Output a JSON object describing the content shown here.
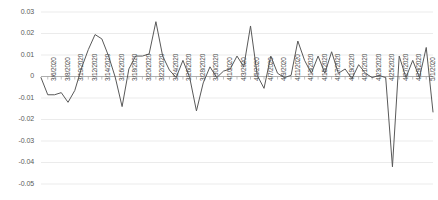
{
  "chart_data": {
    "type": "line",
    "title": "",
    "subtitle": "",
    "xlabel": "",
    "ylabel": "",
    "grid": true,
    "legend_position": "none",
    "series_color": "#595959",
    "ylim": [
      -0.05,
      0.03
    ],
    "ytick_labels": [
      "0.03",
      "0.02",
      "0.01",
      "0",
      "-0.01",
      "-0.02",
      "-0.03",
      "-0.04",
      "-0.05"
    ],
    "ytick_values": [
      0.03,
      0.02,
      0.01,
      0,
      -0.01,
      -0.02,
      -0.03,
      -0.04,
      -0.05
    ],
    "xtick_labels": [
      "3/6/2020",
      "3/8/2020",
      "3/10/2020",
      "3/12/2020",
      "3/14/2020",
      "3/16/2020",
      "3/18/2020",
      "3/20/2020",
      "3/22/2020",
      "3/24/2020",
      "3/26/2020",
      "3/28/2020",
      "3/30/2020",
      "4/1/2020",
      "4/3/2020",
      "4/5/2020",
      "4/7/2020",
      "4/9/2020",
      "4/11/2020",
      "4/13/2020",
      "4/15/2020",
      "4/17/2020",
      "4/19/2020",
      "4/21/2020",
      "4/23/2020",
      "4/25/2020",
      "4/27/2020",
      "4/29/2020",
      "5/1/2020"
    ],
    "x": [
      "3/5/2020",
      "3/6/2020",
      "3/7/2020",
      "3/8/2020",
      "3/9/2020",
      "3/10/2020",
      "3/11/2020",
      "3/12/2020",
      "3/13/2020",
      "3/14/2020",
      "3/15/2020",
      "3/16/2020",
      "3/17/2020",
      "3/18/2020",
      "3/19/2020",
      "3/20/2020",
      "3/21/2020",
      "3/22/2020",
      "3/23/2020",
      "3/24/2020",
      "3/25/2020",
      "3/26/2020",
      "3/27/2020",
      "3/28/2020",
      "3/29/2020",
      "3/30/2020",
      "3/31/2020",
      "4/1/2020",
      "4/2/2020",
      "4/3/2020",
      "4/4/2020",
      "4/5/2020",
      "4/6/2020",
      "4/7/2020",
      "4/8/2020",
      "4/9/2020",
      "4/10/2020",
      "4/11/2020",
      "4/12/2020",
      "4/13/2020",
      "4/14/2020",
      "4/15/2020",
      "4/16/2020",
      "4/17/2020",
      "4/18/2020",
      "4/19/2020",
      "4/20/2020",
      "4/21/2020",
      "4/22/2020",
      "4/23/2020",
      "4/24/2020",
      "4/25/2020",
      "4/26/2020",
      "4/27/2020",
      "4/28/2020",
      "4/29/2020",
      "4/30/2020",
      "5/1/2020",
      "5/2/2020"
    ],
    "values": [
      -0.0005,
      -0.0085,
      -0.0085,
      -0.0075,
      -0.012,
      -0.0065,
      0.004,
      0.0125,
      0.0195,
      0.0175,
      0.0095,
      -0.0005,
      -0.014,
      0.0035,
      0.0095,
      0.0095,
      0.0105,
      0.0255,
      0.0095,
      0.003,
      -0.0005,
      0.0075,
      -0.0005,
      -0.016,
      -0.003,
      0.0045,
      -0.0005,
      0.0025,
      0.0035,
      0.0095,
      0.0045,
      0.0235,
      0.0005,
      -0.0055,
      0.0095,
      0.0015,
      -0.0005,
      0.0005,
      0.0165,
      0.0075,
      0.0015,
      0.0095,
      0.0015,
      0.0115,
      0.0015,
      0.0035,
      -0.001,
      0.0055,
      0.0015,
      -0.0005,
      0.0005,
      -0.0005,
      -0.042,
      0.0095,
      -0.0005,
      0.0075,
      -0.0005,
      0.0135,
      -0.0165
    ]
  }
}
